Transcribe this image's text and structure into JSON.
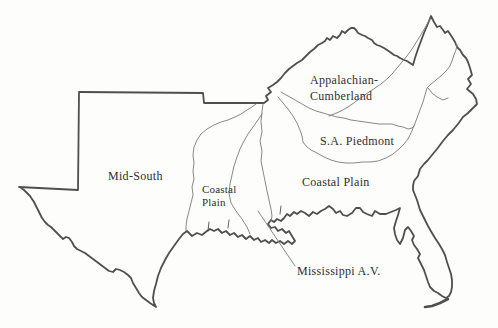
{
  "figure": {
    "type": "physiographic-region-map-line-art",
    "labels": {
      "mid_south": "Mid-South",
      "coastal_plain_west": [
        "Coastal",
        "Plain"
      ],
      "appalachian": [
        "Appalachian-",
        "Cumberland"
      ],
      "piedmont": "S.A. Piedmont",
      "coastal_plain_east": "Coastal Plain",
      "mississippi_av": "Mississippi A.V."
    },
    "colors": {
      "background": "#fdfdfb",
      "outline": "#4f4f4f",
      "interior_line": "#7a7a7a",
      "text": "#2e2e2e"
    }
  }
}
